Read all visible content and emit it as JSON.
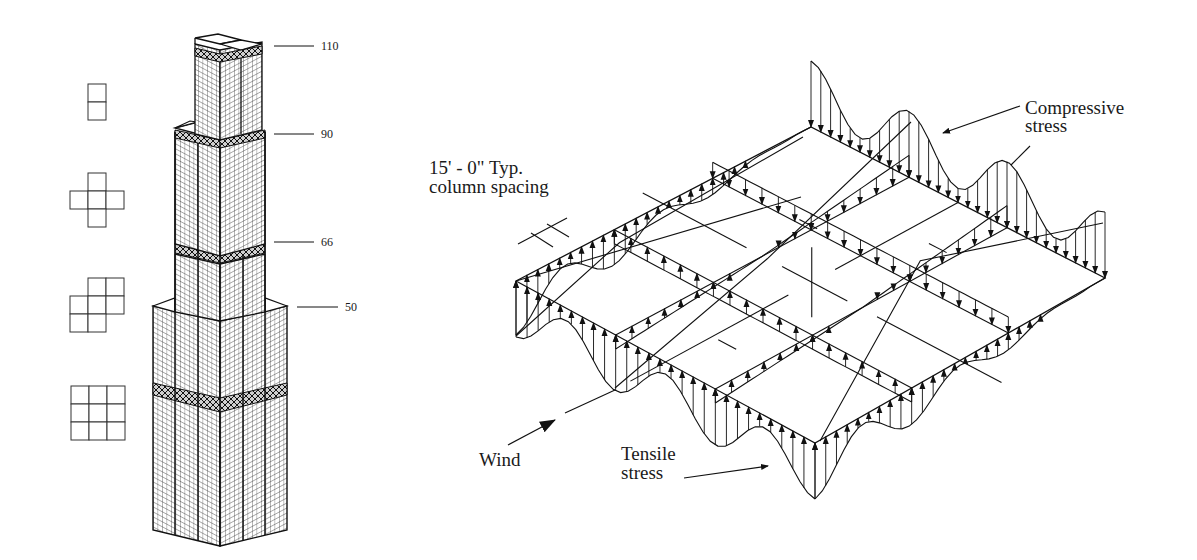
{
  "building": {
    "levels": [
      {
        "label": "110",
        "x": 321,
        "y": 40,
        "line_x1": 274,
        "line_x2": 314,
        "line_y": 46
      },
      {
        "label": "90",
        "x": 321,
        "y": 128,
        "line_x1": 274,
        "line_x2": 314,
        "line_y": 134
      },
      {
        "label": "66",
        "x": 321,
        "y": 236,
        "line_x1": 274,
        "line_x2": 314,
        "line_y": 242
      },
      {
        "label": "50",
        "x": 345,
        "y": 301,
        "line_x1": 297,
        "line_x2": 338,
        "line_y": 307
      }
    ],
    "plan_icons": [
      {
        "name": "plan-2-tubes",
        "cells": [
          [
            1,
            0
          ],
          [
            1,
            1
          ]
        ],
        "x0": 70,
        "y0": 84
      },
      {
        "name": "plan-cross-5-tubes",
        "cells": [
          [
            1,
            0
          ],
          [
            0,
            1
          ],
          [
            1,
            1
          ],
          [
            2,
            1
          ],
          [
            1,
            2
          ]
        ],
        "x0": 70,
        "y0": 173
      },
      {
        "name": "plan-7-tubes",
        "cells": [
          [
            1,
            0
          ],
          [
            2,
            0
          ],
          [
            0,
            1
          ],
          [
            1,
            1
          ],
          [
            2,
            1
          ],
          [
            0,
            2
          ],
          [
            1,
            2
          ]
        ],
        "x0": 70,
        "y0": 278
      },
      {
        "name": "plan-9-tubes",
        "cells": [
          [
            0,
            0
          ],
          [
            1,
            0
          ],
          [
            2,
            0
          ],
          [
            0,
            1
          ],
          [
            1,
            1
          ],
          [
            2,
            1
          ],
          [
            0,
            2
          ],
          [
            1,
            2
          ],
          [
            2,
            2
          ]
        ],
        "x0": 71,
        "y0": 386
      }
    ]
  },
  "stress_diagram": {
    "labels": {
      "column_spacing_line1": "15' - 0\" Typ.",
      "column_spacing_line2": "column spacing",
      "compressive_line1": "Compressive",
      "compressive_line2": "stress",
      "tensile_line1": "Tensile",
      "tensile_line2": "stress",
      "wind": "Wind"
    },
    "plate_corners": {
      "back": [
        811,
        127
      ],
      "right": [
        1105,
        278
      ],
      "front": [
        815,
        443
      ],
      "left": [
        516,
        281
      ]
    },
    "grid": "3x3"
  }
}
